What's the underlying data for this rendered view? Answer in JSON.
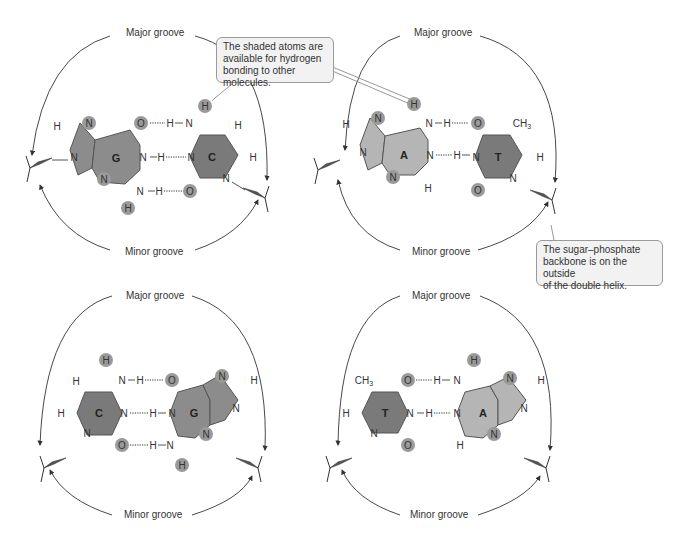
{
  "figure": {
    "groove_labels": {
      "major": "Major groove",
      "minor": "Minor groove"
    },
    "panels": [
      {
        "id": "gc-top",
        "left_base": "G",
        "right_base": "C"
      },
      {
        "id": "at-top",
        "left_base": "A",
        "right_base": "T"
      },
      {
        "id": "cg-bottom",
        "left_base": "C",
        "right_base": "G"
      },
      {
        "id": "ta-bottom",
        "left_base": "T",
        "right_base": "A"
      }
    ],
    "atoms": {
      "N": "N",
      "H": "H",
      "O": "O",
      "CH3": "CH",
      "CH3_sub": "3"
    },
    "callouts": {
      "shaded_atoms": [
        "The shaded atoms are",
        "available for hydrogen",
        "bonding to other molecules."
      ],
      "backbone": [
        "The sugar–phosphate",
        "backbone is on the outside",
        "of the double helix."
      ]
    },
    "colors": {
      "purine_dark": "#8c8c8c",
      "pyrimidine_dark": "#7a7a7a",
      "adenine_light": "#b5b5b5",
      "shaded_atom": "#9a9a9a",
      "callout_bg": "#f2f2f2"
    }
  }
}
